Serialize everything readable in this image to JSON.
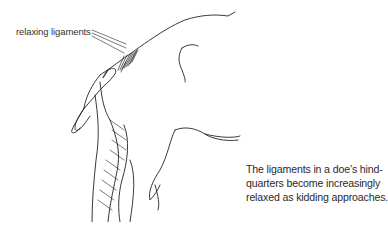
{
  "illustration": {
    "subject": "goat hindquarters line drawing",
    "label": "relaxing ligaments"
  },
  "caption": {
    "lines": [
      "The ligaments in a doe’s hind-",
      "quarters become increasingly",
      "relaxed as kidding approaches."
    ]
  }
}
